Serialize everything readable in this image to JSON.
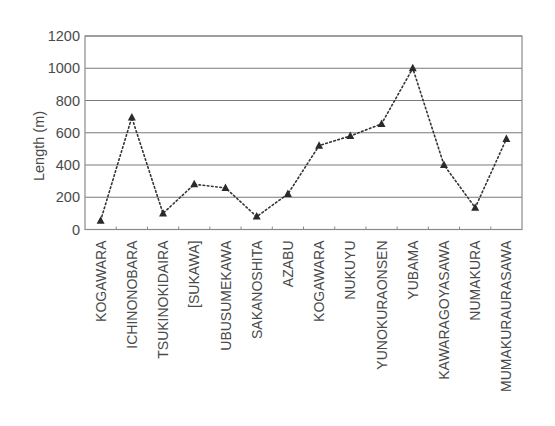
{
  "chart_data": {
    "type": "line",
    "title": "",
    "xlabel": "",
    "ylabel": "Length (m)",
    "ylim": [
      0,
      1200
    ],
    "yticks": [
      0,
      200,
      400,
      600,
      800,
      1000,
      1200
    ],
    "grid": "horizontal",
    "legend": "none",
    "marker": "triangle",
    "line_style": "dotted",
    "categories": [
      "KOGAWARA",
      "ICHINONOBARA",
      "TSUKINOKIDAIRA",
      "[SUKAWA]",
      "UBUSUMEKAWA",
      "SAKANOSHITA",
      "AZABU",
      "KOGAWARA",
      "NUKUYU",
      "YUNOKURAONSEN",
      "YUBAMA",
      "KAWARAGOYASAWA",
      "NUMAKURA",
      "MUMAKURAURASAWA"
    ],
    "values": [
      55,
      695,
      100,
      280,
      258,
      80,
      220,
      520,
      580,
      655,
      1000,
      400,
      135,
      562
    ],
    "series": [
      {
        "name": "Length",
        "values": [
          55,
          695,
          100,
          280,
          258,
          80,
          220,
          520,
          580,
          655,
          1000,
          400,
          135,
          562
        ]
      }
    ],
    "colors": {
      "line": "#333333",
      "marker": "#2a2a2a",
      "grid": "#7a7a7a",
      "axis": "#8a8a8a",
      "text": "#4a4a4a"
    }
  }
}
